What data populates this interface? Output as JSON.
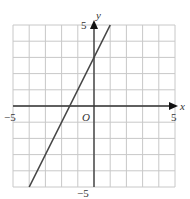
{
  "chart_data": {
    "type": "line",
    "title": "",
    "xlabel": "x",
    "ylabel": "y",
    "xlim": [
      -5,
      5
    ],
    "ylim": [
      -5,
      5
    ],
    "grid": true,
    "grid_step": 1,
    "origin_label": "O",
    "tick_labels": {
      "x_min": "−5",
      "x_max": "5",
      "y_min": "−5",
      "y_max": "5"
    },
    "series": [
      {
        "name": "y = 2x + 3",
        "equation": "y = 2x + 3",
        "slope": 2,
        "intercept": 3,
        "x": [
          -4,
          1
        ],
        "y": [
          -5,
          5
        ]
      }
    ],
    "colors": {
      "grid": "#c8c8c8",
      "axis": "#333333",
      "line": "#444444"
    }
  }
}
